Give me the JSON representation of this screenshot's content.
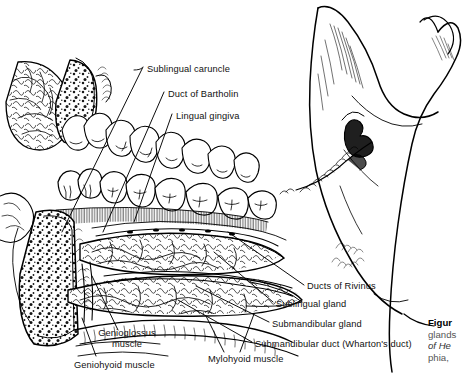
{
  "figure": {
    "kind": "anatomical-line-drawing",
    "background_color": "#ffffff",
    "ink_color": "#000000"
  },
  "labels": [
    {
      "id": "sublingual-caruncle",
      "text": "Sublingual caruncle",
      "x": 147,
      "y": 70,
      "align": "left"
    },
    {
      "id": "duct-of-bartholin",
      "text": "Duct of Bartholin",
      "x": 168,
      "y": 95,
      "align": "left"
    },
    {
      "id": "lingual-gingiva",
      "text": "Lingual gingiva",
      "x": 176,
      "y": 117,
      "align": "left"
    },
    {
      "id": "ducts-of-rivinus",
      "text": "Ducts of Rivinus",
      "x": 307,
      "y": 287,
      "align": "left"
    },
    {
      "id": "sublingual-gland",
      "text": "Sublingual gland",
      "x": 276,
      "y": 305,
      "align": "left"
    },
    {
      "id": "submandibular-gland",
      "text": "Submandibular gland",
      "x": 272,
      "y": 325,
      "align": "left"
    },
    {
      "id": "submandibular-duct",
      "text": "Submandibular duct (Wharton's duct)",
      "x": 255,
      "y": 345,
      "align": "left"
    },
    {
      "id": "mylohyoid-muscle",
      "text": "Mylohyoid muscle",
      "x": 208,
      "y": 360,
      "align": "left"
    },
    {
      "id": "geniohyoid-muscle",
      "text": "Geniohyoid muscle",
      "x": 74,
      "y": 364,
      "align": "left"
    }
  ],
  "labels_stacked": [
    {
      "id": "genioglossus-muscle",
      "line1": "Genioglossus",
      "line2": "muscle",
      "x": 94,
      "y": 334
    }
  ],
  "caption": {
    "line1_bold": "Figur",
    "line2": "glands",
    "line3_italic": "of He",
    "line4": "phia,",
    "x": 428,
    "y": 318,
    "truncated": true
  },
  "structures": [
    "mandible ramus",
    "coronoid process",
    "condylar process",
    "mandibular foramen",
    "mylohyoid line",
    "upper dental arch",
    "lower dental arch",
    "cancellous bone cross-section",
    "sublingual gland",
    "submandibular gland",
    "genioglossus muscle",
    "geniohyoid muscle",
    "mylohyoid muscle"
  ]
}
